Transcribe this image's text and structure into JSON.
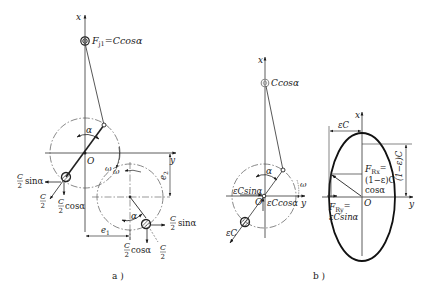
{
  "figure_a": {
    "caption": "a )",
    "axis_x": "x",
    "axis_y": "y",
    "origin": "O",
    "angle": "α",
    "omega": "ω",
    "omega2": "ω",
    "top_mass_label": "F",
    "top_mass_sub": "j1",
    "top_mass_expr": "=Ccosα",
    "cw1_sin": {
      "num": "C",
      "den": "2",
      "trig": "sinα"
    },
    "cw1_c": {
      "num": "C",
      "den": "2"
    },
    "cw1_cos": {
      "num": "C",
      "den": "2",
      "trig": "cosα"
    },
    "cw2_sin": {
      "num": "C",
      "den": "2",
      "trig": "sinα"
    },
    "cw2_c": {
      "num": "C",
      "den": "2"
    },
    "cw2_cos": {
      "num": "C",
      "den": "2",
      "trig": "cosα"
    },
    "dim_e1": "e",
    "dim_e1_sub": "1",
    "dim_e2": "e",
    "dim_e2_sub": "2",
    "angle2": "α"
  },
  "figure_b": {
    "caption": "b )",
    "axis_x": "x",
    "axis_y": "y",
    "origin": "O",
    "angle": "α",
    "omega": "ω",
    "top_mass_expr": "Ccosα",
    "ecsin": "εCsinα",
    "eccos": "εCcosα",
    "ec": "εC"
  },
  "ellipse": {
    "axis_x": "x",
    "axis_y": "y",
    "origin": "O",
    "dim_top": "εC",
    "dim_right": "(1−ε)C",
    "frx_label": "F",
    "frx_sub": "Rx",
    "frx_eq": "=",
    "frx_line2": "(1−ε)C",
    "frx_line3": "cosα",
    "fry_label": "F",
    "fry_sub": "Ry",
    "fry_eq": "=",
    "fry_line2": "εCsinα"
  }
}
